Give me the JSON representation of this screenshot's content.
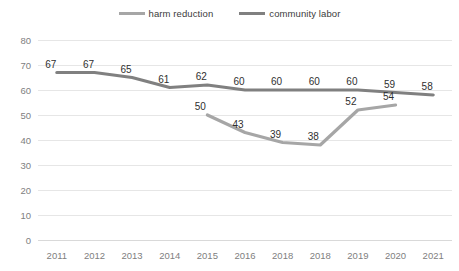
{
  "chart_data": {
    "type": "line",
    "title": "",
    "subtitle": "",
    "xlabel": "",
    "ylabel": "",
    "categories": [
      "2011",
      "2012",
      "2013",
      "2014",
      "2015",
      "2016",
      "2018",
      "2018",
      "2019",
      "2020",
      "2021"
    ],
    "ylim": [
      0,
      80
    ],
    "yticks": [
      0,
      10,
      20,
      30,
      40,
      50,
      60,
      70,
      80
    ],
    "grid": "horizontal",
    "legend_position": "top-center",
    "series": [
      {
        "name": "harm reduction",
        "color": "#a6a6a6",
        "values": [
          null,
          null,
          null,
          null,
          50,
          43,
          39,
          38,
          52,
          54,
          null
        ],
        "labels": [
          "",
          "",
          "",
          "",
          "50",
          "43",
          "39",
          "38",
          "52",
          "54",
          ""
        ]
      },
      {
        "name": "community labor",
        "color": "#808080",
        "values": [
          67,
          67,
          65,
          61,
          62,
          60,
          60,
          60,
          60,
          59,
          58
        ],
        "labels": [
          "67",
          "67",
          "65",
          "61",
          "62",
          "60",
          "60",
          "60",
          "60",
          "59",
          "58"
        ]
      }
    ]
  },
  "legend": {
    "items": [
      {
        "label": "harm reduction",
        "color": "#a6a6a6"
      },
      {
        "label": "community labor",
        "color": "#808080"
      }
    ]
  },
  "axes": {
    "y_tick_labels": [
      "80",
      "70",
      "60",
      "50",
      "40",
      "30",
      "20",
      "10",
      "0"
    ],
    "x_tick_labels": [
      "2011",
      "2012",
      "2013",
      "2014",
      "2015",
      "2016",
      "2018",
      "2018",
      "2019",
      "2020",
      "2021"
    ]
  }
}
